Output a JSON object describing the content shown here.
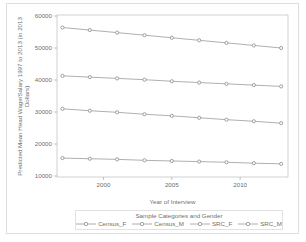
{
  "chart": {
    "y_axis_label_line1": "Predicted Mean Head Wage/Salary 1997 to 2013 (in 2013",
    "y_axis_label_line2": "Dollars)",
    "x_axis_label": "Year of Interview",
    "legend_title": "Sample Categories and Gender"
  },
  "chart_data": {
    "type": "line",
    "title": "",
    "xlabel": "Year of Interview",
    "ylabel": "Predicted Mean Head Wage/Salary 1997 to 2013 (in 2013 Dollars)",
    "legend_title": "Sample Categories and Gender",
    "legend_position": "bottom",
    "grid": false,
    "marker": "circle-open",
    "line_color": "#9a9a9a",
    "marker_color": "#8a8a8a",
    "frame_color": "#c6c6c6",
    "text_color": "#6f6f6f",
    "x": [
      1997,
      1999,
      2001,
      2003,
      2005,
      2007,
      2009,
      2011,
      2013
    ],
    "x_ticks": [
      2000,
      2005,
      2010
    ],
    "y_ticks": [
      10000,
      20000,
      30000,
      40000,
      50000,
      60000
    ],
    "xlim": [
      1996.6,
      2013.5
    ],
    "ylim": [
      10000,
      60000
    ],
    "series": [
      {
        "name": "Census_F",
        "values": [
          15600,
          15400,
          15200,
          14900,
          14700,
          14500,
          14300,
          14000,
          13800
        ]
      },
      {
        "name": "Census_M",
        "values": [
          41300,
          40900,
          40500,
          40100,
          39600,
          39200,
          38800,
          38400,
          38000
        ]
      },
      {
        "name": "SRC_F",
        "values": [
          31000,
          30400,
          29900,
          29300,
          28800,
          28200,
          27600,
          27100,
          26500
        ]
      },
      {
        "name": "SRC_M",
        "values": [
          56400,
          55600,
          54800,
          54000,
          53200,
          52400,
          51600,
          50800,
          50000
        ]
      }
    ]
  }
}
